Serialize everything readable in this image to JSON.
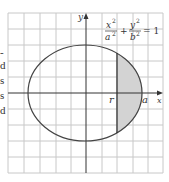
{
  "left_text_fragments": [
    "-",
    "d",
    "s",
    "s",
    "d"
  ],
  "equation": {
    "x_num": "x",
    "x_exp": "2",
    "x_den": "a",
    "x_den_exp": "2",
    "plus": "+",
    "y_num": "y",
    "y_exp": "2",
    "y_den": "b",
    "y_den_exp": "2",
    "equals": "= 1"
  },
  "axis_labels": {
    "x": "x",
    "y": "y"
  },
  "point_labels": {
    "r": "r",
    "a": "a"
  },
  "colors": {
    "grid": "#c8c8c8",
    "axis": "#333333",
    "ellipse": "#444444",
    "shade": "#d3d3d3"
  }
}
